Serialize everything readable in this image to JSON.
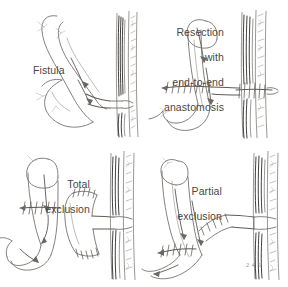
{
  "figure": {
    "style": "pen-and-ink medical line drawing",
    "background_color": "#ffffff",
    "ink_color": "#77736f",
    "label_color": "#4a4744",
    "rows": 2,
    "columns": 2
  },
  "panels": [
    {
      "id": "fistula",
      "label": "Fistula",
      "label_lines": [
        "Fistula"
      ],
      "position": "top-left",
      "description": "Bowel loop with fistulous tract traversing the abdominal wall to the skin",
      "has_anastomosis": false,
      "has_sutures": false,
      "flow_arrows": 2
    },
    {
      "id": "resection-end-to-end",
      "label": "Resection with end-to-end anastomosis",
      "label_lines": [
        "Resection",
        "with",
        "end-to-end",
        "anastomosis"
      ],
      "position": "top-right",
      "description": "Fistula-bearing segment resected and bowel continuity restored by end-to-end anastomosis",
      "has_anastomosis": true,
      "has_sutures": true,
      "flow_arrows": 2
    },
    {
      "id": "total-exclusion",
      "label": "Total exclusion",
      "label_lines": [
        "Total",
        "exclusion"
      ],
      "position": "bottom-left",
      "description": "Fistula-bearing loop completely isolated; both ends oversewn and bowel continuity bypassed",
      "has_anastomosis": false,
      "has_sutures": true,
      "flow_arrows": 2
    },
    {
      "id": "partial-exclusion",
      "label": "Partial exclusion",
      "label_lines": [
        "Partial",
        "exclusion"
      ],
      "position": "bottom-right",
      "description": "Fistula-bearing loop partially bypassed; afferent limb diverted while segment remains in continuity",
      "has_anastomosis": true,
      "has_sutures": true,
      "flow_arrows": 2
    }
  ],
  "annotations": {
    "signature": "2 4 5",
    "caption": ""
  }
}
